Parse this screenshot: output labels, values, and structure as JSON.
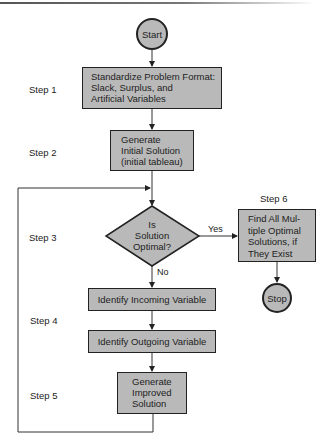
{
  "diagram": {
    "type": "flowchart",
    "nodes": {
      "start": {
        "shape": "circle",
        "label": "Start"
      },
      "step1": {
        "shape": "rect",
        "lines": [
          "Standardize Problem Format:",
          "Slack, Surplus, and",
          "Artificial Variables"
        ]
      },
      "step2": {
        "shape": "rect",
        "lines": [
          "Generate",
          "Initial Solution",
          "(initial tableau)"
        ]
      },
      "decision": {
        "shape": "diamond",
        "lines": [
          "Is",
          "Solution",
          "Optimal?"
        ]
      },
      "step6": {
        "shape": "rect",
        "lines": [
          "Find All Mul-",
          "tiple Optimal",
          "Solutions, if",
          "They Exist"
        ]
      },
      "stop": {
        "shape": "circle",
        "label": "Stop"
      },
      "incoming": {
        "shape": "rect",
        "label": "Identify Incoming Variable"
      },
      "outgoing": {
        "shape": "rect",
        "label": "Identify Outgoing Variable"
      },
      "step5": {
        "shape": "rect",
        "lines": [
          "Generate",
          "Improved",
          "Solution"
        ]
      }
    },
    "step_labels": [
      "Step 1",
      "Step 2",
      "Step 3",
      "Step 4",
      "Step 5",
      "Step 6"
    ],
    "edges": [
      {
        "from": "start",
        "to": "step1",
        "label": ""
      },
      {
        "from": "step1",
        "to": "step2",
        "label": ""
      },
      {
        "from": "step2",
        "to": "decision",
        "label": ""
      },
      {
        "from": "decision",
        "to": "step6",
        "label": "Yes"
      },
      {
        "from": "step6",
        "to": "stop",
        "label": ""
      },
      {
        "from": "decision",
        "to": "incoming",
        "label": "No"
      },
      {
        "from": "incoming",
        "to": "outgoing",
        "label": ""
      },
      {
        "from": "outgoing",
        "to": "step5",
        "label": ""
      },
      {
        "from": "step5",
        "to": "decision",
        "label": ""
      }
    ],
    "colors": {
      "node_fill": "#b9b9b9",
      "stroke": "#222222",
      "background": "#ffffff"
    }
  }
}
